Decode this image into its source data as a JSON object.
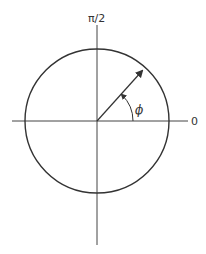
{
  "diagram": {
    "labels": {
      "top_axis": "π/2",
      "right_axis": "0",
      "angle": "ϕ"
    },
    "colors": {
      "stroke": "#333333",
      "background": "#ffffff"
    }
  }
}
